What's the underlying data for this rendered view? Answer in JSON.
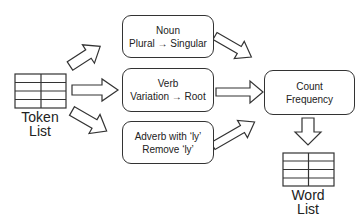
{
  "diagram": {
    "input": {
      "label_line1": "Token",
      "label_line2": "List",
      "icon": "table-icon"
    },
    "processes": [
      {
        "line1": "Noun",
        "line2": "Plural → Singular"
      },
      {
        "line1": "Verb",
        "line2": "Variation → Root"
      },
      {
        "line1": "Adverb with ‘ly’",
        "line2": "Remove ‘ly’"
      }
    ],
    "aggregate": {
      "line1": "Count",
      "line2": "Frequency"
    },
    "output": {
      "label_line1": "Word",
      "label_line2": "List",
      "icon": "table-icon"
    },
    "colors": {
      "stroke": "#333333",
      "fill": "#ffffff",
      "text": "#222222"
    }
  }
}
